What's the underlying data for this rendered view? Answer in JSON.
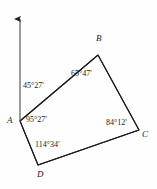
{
  "figure": {
    "type": "geometry-diagram",
    "background_color": "#fefefe",
    "stroke_color": "#1a1a1a",
    "vertices": [
      {
        "id": "A",
        "label": "A",
        "x": 20,
        "y": 121
      },
      {
        "id": "B",
        "label": "B",
        "x": 98,
        "y": 55
      },
      {
        "id": "C",
        "label": "C",
        "x": 139,
        "y": 130
      },
      {
        "id": "D",
        "label": "D",
        "x": 38,
        "y": 165
      }
    ],
    "north_arrow": {
      "name": "north-arrow",
      "from_x": 20,
      "from_y": 121,
      "to_x": 20,
      "to_y": 16
    },
    "angles": [
      {
        "id": "north-bearing",
        "label": "45°27'",
        "degrees": 45,
        "minutes": 27,
        "at": "A-to-north"
      },
      {
        "id": "angle-A",
        "label": "95°27'",
        "degrees": 95,
        "minutes": 27,
        "at": "A"
      },
      {
        "id": "angle-B",
        "label": "65°47'",
        "degrees": 65,
        "minutes": 47,
        "at": "B"
      },
      {
        "id": "angle-C",
        "label": "84°12'",
        "degrees": 84,
        "minutes": 12,
        "at": "C"
      },
      {
        "id": "angle-D",
        "label": "114°34'",
        "degrees": 114,
        "minutes": 34,
        "at": "D"
      }
    ],
    "caption_remnant": "——  — —"
  }
}
